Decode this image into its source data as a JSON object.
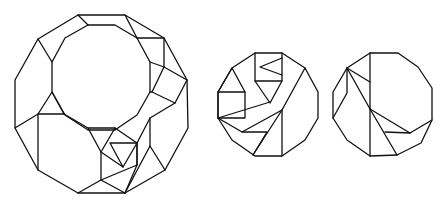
{
  "diagram": {
    "type": "geometric-dissection",
    "stroke_color": "#111111",
    "background": "#ffffff",
    "figures": [
      {
        "id": "large-dodecagon",
        "polylines": [
          [
            [
              78,
              15
            ],
            [
              125,
              15
            ],
            [
              164,
              38
            ],
            [
              187,
              80
            ],
            [
              188,
              128
            ],
            [
              165,
              170
            ],
            [
              125,
              193
            ],
            [
              78,
              193
            ],
            [
              38,
              170
            ],
            [
              15,
              128
            ],
            [
              15,
              80
            ],
            [
              38,
              39
            ],
            [
              78,
              15
            ]
          ],
          [
            [
              88,
              25
            ],
            [
              115,
              25
            ],
            [
              137,
              38
            ],
            [
              150,
              62
            ],
            [
              150,
              92
            ],
            [
              137,
              115
            ],
            [
              115,
              130
            ],
            [
              88,
              130
            ],
            [
              65,
              115
            ],
            [
              52,
              92
            ],
            [
              52,
              62
            ],
            [
              65,
              38
            ],
            [
              88,
              25
            ]
          ],
          [
            [
              78,
              15
            ],
            [
              88,
              25
            ]
          ],
          [
            [
              38,
              39
            ],
            [
              52,
              62
            ]
          ],
          [
            [
              125,
              15
            ],
            [
              137,
              38
            ]
          ],
          [
            [
              137,
              38
            ],
            [
              164,
              38
            ],
            [
              164,
              67
            ]
          ],
          [
            [
              150,
              62
            ],
            [
              164,
              67
            ],
            [
              187,
              80
            ]
          ],
          [
            [
              164,
              67
            ],
            [
              152,
              92
            ],
            [
              175,
              103
            ],
            [
              187,
              80
            ]
          ],
          [
            [
              152,
              92
            ],
            [
              150,
              92
            ]
          ],
          [
            [
              175,
              103
            ],
            [
              150,
              118
            ],
            [
              137,
              143
            ]
          ],
          [
            [
              15,
              128
            ],
            [
              38,
              114
            ],
            [
              52,
              92
            ],
            [
              64,
              114
            ],
            [
              38,
              114
            ]
          ],
          [
            [
              38,
              114
            ],
            [
              38,
              170
            ]
          ],
          [
            [
              64,
              114
            ],
            [
              88,
              128
            ]
          ],
          [
            [
              88,
              128
            ],
            [
              115,
              128
            ],
            [
              101,
              152
            ],
            [
              88,
              128
            ]
          ],
          [
            [
              115,
              128
            ],
            [
              137,
              143
            ],
            [
              137,
              165
            ]
          ],
          [
            [
              110,
              143
            ],
            [
              137,
              143
            ],
            [
              123,
              167
            ],
            [
              110,
              143
            ]
          ],
          [
            [
              101,
              152
            ],
            [
              123,
              167
            ]
          ],
          [
            [
              101,
              152
            ],
            [
              101,
              180
            ],
            [
              125,
              193
            ]
          ],
          [
            [
              78,
              193
            ],
            [
              101,
              180
            ],
            [
              137,
              165
            ]
          ],
          [
            [
              137,
              143
            ],
            [
              137,
              165
            ],
            [
              125,
              193
            ]
          ],
          [
            [
              150,
              118
            ],
            [
              150,
              146
            ],
            [
              165,
              170
            ]
          ],
          [
            [
              150,
              146
            ],
            [
              125,
              193
            ]
          ]
        ]
      },
      {
        "id": "middle-dodecagon",
        "polylines": [
          [
            [
              255,
              53
            ],
            [
              282,
              53
            ],
            [
              305,
              68
            ],
            [
              318,
              92
            ],
            [
              318,
              118
            ],
            [
              305,
              140
            ],
            [
              282,
              156
            ],
            [
              255,
              156
            ],
            [
              232,
              140
            ],
            [
              218,
              118
            ],
            [
              218,
              92
            ],
            [
              232,
              68
            ],
            [
              255,
              53
            ]
          ],
          [
            [
              255,
              53
            ],
            [
              255,
              81
            ],
            [
              282,
              81
            ],
            [
              282,
              53
            ]
          ],
          [
            [
              282,
              58
            ],
            [
              260,
              67
            ],
            [
              282,
              75
            ]
          ],
          [
            [
              232,
              68
            ],
            [
              218,
              92
            ],
            [
              245,
              92
            ],
            [
              232,
              68
            ]
          ],
          [
            [
              218,
              92
            ],
            [
              218,
              118
            ],
            [
              245,
              118
            ],
            [
              245,
              92
            ]
          ],
          [
            [
              255,
              81
            ],
            [
              270,
              103
            ],
            [
              282,
              81
            ]
          ],
          [
            [
              218,
              118
            ],
            [
              270,
              102
            ]
          ],
          [
            [
              218,
              118
            ],
            [
              242,
              132
            ],
            [
              267,
              132
            ],
            [
              253,
              155
            ]
          ],
          [
            [
              242,
              132
            ],
            [
              282,
              110
            ]
          ],
          [
            [
              305,
              68
            ],
            [
              282,
              110
            ],
            [
              282,
              156
            ]
          ],
          [
            [
              282,
              110
            ],
            [
              253,
              155
            ]
          ]
        ]
      },
      {
        "id": "right-dodecagon",
        "polylines": [
          [
            [
              370,
              53
            ],
            [
              398,
              53
            ],
            [
              418,
              67
            ],
            [
              432,
              88
            ],
            [
              432,
              120
            ],
            [
              421,
              143
            ],
            [
              397,
              155
            ],
            [
              370,
              156
            ],
            [
              347,
              140
            ],
            [
              333,
              118
            ],
            [
              333,
              92
            ],
            [
              347,
              68
            ],
            [
              370,
              53
            ]
          ],
          [
            [
              370,
              53
            ],
            [
              370,
              156
            ]
          ],
          [
            [
              347,
              68
            ],
            [
              370,
              82
            ]
          ],
          [
            [
              347,
              68
            ],
            [
              370,
              109
            ]
          ],
          [
            [
              347,
              68
            ],
            [
              347,
              93
            ],
            [
              333,
              118
            ]
          ],
          [
            [
              370,
              109
            ],
            [
              410,
              133
            ],
            [
              432,
              120
            ]
          ],
          [
            [
              370,
              109
            ],
            [
              397,
              155
            ]
          ],
          [
            [
              385,
              132
            ],
            [
              410,
              133
            ]
          ]
        ]
      }
    ]
  }
}
